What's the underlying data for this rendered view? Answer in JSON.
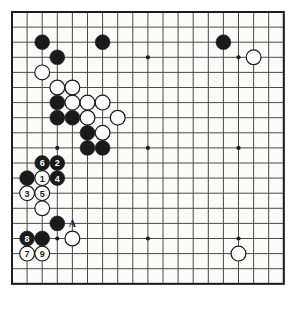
{
  "diagram": {
    "kind": "go-board-diagram",
    "board_size": 19,
    "visible_columns": 19,
    "visible_rows": 19,
    "colors": {
      "background": "#ffffff",
      "board": "#fbfbfa",
      "grid_line": "#4a4a4a",
      "border_line": "#1c1c1c",
      "black_stone": "#1a1a1a",
      "white_stone": "#ffffff",
      "white_stone_edge": "#1a1a1a",
      "black_label_text": "#ffffff",
      "white_label_text": "#1a1a1a",
      "mark_text": "#1a1a1a",
      "star_point": "#1c1c1c"
    },
    "geometry": {
      "origin_x": 12,
      "origin_y": 12,
      "cell": 15.1,
      "stone_radius": 7.4,
      "star_radius": 2.1,
      "line_width": 1,
      "border_width": 2
    },
    "star_points": [
      {
        "col": 4,
        "row": 4
      },
      {
        "col": 10,
        "row": 4
      },
      {
        "col": 16,
        "row": 4
      },
      {
        "col": 4,
        "row": 10
      },
      {
        "col": 10,
        "row": 10
      },
      {
        "col": 16,
        "row": 10
      },
      {
        "col": 4,
        "row": 16
      },
      {
        "col": 10,
        "row": 16
      },
      {
        "col": 16,
        "row": 16
      }
    ],
    "stones": [
      {
        "col": 3,
        "row": 3,
        "color": "black",
        "label": ""
      },
      {
        "col": 7,
        "row": 3,
        "color": "black",
        "label": ""
      },
      {
        "col": 15,
        "row": 3,
        "color": "black",
        "label": ""
      },
      {
        "col": 4,
        "row": 4,
        "color": "black",
        "label": ""
      },
      {
        "col": 17,
        "row": 4,
        "color": "white",
        "label": ""
      },
      {
        "col": 3,
        "row": 5,
        "color": "white",
        "label": ""
      },
      {
        "col": 4,
        "row": 6,
        "color": "white",
        "label": ""
      },
      {
        "col": 5,
        "row": 6,
        "color": "white",
        "label": ""
      },
      {
        "col": 4,
        "row": 7,
        "color": "black",
        "label": ""
      },
      {
        "col": 5,
        "row": 7,
        "color": "white",
        "label": ""
      },
      {
        "col": 6,
        "row": 7,
        "color": "white",
        "label": ""
      },
      {
        "col": 7,
        "row": 7,
        "color": "white",
        "label": ""
      },
      {
        "col": 4,
        "row": 8,
        "color": "black",
        "label": ""
      },
      {
        "col": 5,
        "row": 8,
        "color": "black",
        "label": ""
      },
      {
        "col": 6,
        "row": 8,
        "color": "white",
        "label": ""
      },
      {
        "col": 8,
        "row": 8,
        "color": "white",
        "label": ""
      },
      {
        "col": 6,
        "row": 9,
        "color": "black",
        "label": ""
      },
      {
        "col": 7,
        "row": 9,
        "color": "white",
        "label": ""
      },
      {
        "col": 6,
        "row": 10,
        "color": "black",
        "label": ""
      },
      {
        "col": 7,
        "row": 10,
        "color": "black",
        "label": ""
      },
      {
        "col": 3,
        "row": 11,
        "color": "black",
        "label": "6"
      },
      {
        "col": 4,
        "row": 11,
        "color": "black",
        "label": "2"
      },
      {
        "col": 2,
        "row": 12,
        "color": "black",
        "label": ""
      },
      {
        "col": 3,
        "row": 12,
        "color": "white",
        "label": "1"
      },
      {
        "col": 4,
        "row": 12,
        "color": "black",
        "label": "4"
      },
      {
        "col": 2,
        "row": 13,
        "color": "white",
        "label": "3"
      },
      {
        "col": 3,
        "row": 13,
        "color": "white",
        "label": "5"
      },
      {
        "col": 3,
        "row": 14,
        "color": "white",
        "label": ""
      },
      {
        "col": 4,
        "row": 15,
        "color": "black",
        "label": ""
      },
      {
        "col": 2,
        "row": 16,
        "color": "black",
        "label": "8"
      },
      {
        "col": 3,
        "row": 16,
        "color": "black",
        "label": ""
      },
      {
        "col": 5,
        "row": 16,
        "color": "white",
        "label": ""
      },
      {
        "col": 16,
        "row": 17,
        "color": "white",
        "label": ""
      },
      {
        "col": 2,
        "row": 17,
        "color": "white",
        "label": "7"
      },
      {
        "col": 3,
        "row": 17,
        "color": "white",
        "label": "9"
      }
    ],
    "board_marks": [
      {
        "col": 5,
        "row": 15,
        "text": "A"
      }
    ],
    "move_numbers": [
      "1",
      "2",
      "3",
      "4",
      "5",
      "6",
      "7",
      "8",
      "9"
    ]
  }
}
